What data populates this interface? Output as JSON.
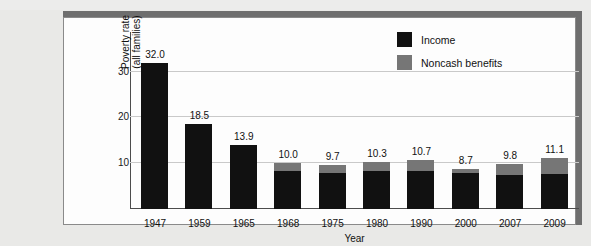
{
  "chart_data": {
    "type": "bar",
    "stacked": true,
    "title": "",
    "xlabel": "Year",
    "ylabel": "Poverty rate\n(all families)",
    "ylabel_lines": [
      "Poverty rate",
      "(all families)"
    ],
    "categories": [
      "1947",
      "1959",
      "1965",
      "1968",
      "1975",
      "1980",
      "1990",
      "2000",
      "2007",
      "2009"
    ],
    "totals": [
      32.0,
      18.5,
      13.9,
      10.0,
      9.7,
      10.3,
      10.7,
      8.7,
      9.8,
      11.1
    ],
    "data_labels": [
      "32.0",
      "18.5",
      "13.9",
      "10.0",
      "9.7",
      "10.3",
      "10.7",
      "8.7",
      "9.8",
      "11.1"
    ],
    "series": [
      {
        "name": "Income",
        "color": "#111111",
        "values": [
          32.0,
          18.5,
          13.9,
          8.2,
          7.8,
          8.4,
          8.3,
          7.8,
          7.5,
          7.6
        ]
      },
      {
        "name": "Noncash benefits",
        "color": "#767676",
        "values": [
          0.0,
          0.0,
          0.0,
          1.8,
          1.9,
          1.9,
          2.4,
          0.9,
          2.3,
          3.5
        ]
      }
    ],
    "ylim": [
      0,
      37.8
    ],
    "yticks": [
      10,
      20,
      30
    ],
    "ytick_labels": [
      "10",
      "20",
      "30"
    ],
    "grid": true,
    "legend_position": "top-right"
  },
  "legend": {
    "items": [
      {
        "label": "Income",
        "swatch": "income"
      },
      {
        "label": "Noncash benefits",
        "swatch": "noncash"
      }
    ]
  },
  "colors": {
    "income": "#111111",
    "noncash": "#767676",
    "grid": "#c9c9c9",
    "axis": "#4c4c4c",
    "page_background": "#e9e9e7",
    "plate_background": "#fdfdfd",
    "frame_shadow": "#6e6e6e"
  }
}
